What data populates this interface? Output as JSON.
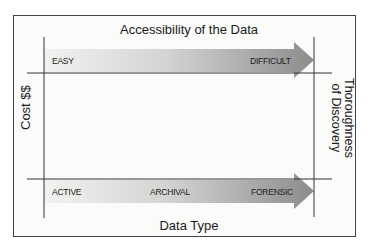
{
  "diagram": {
    "top_title": "Accessibility of the Data",
    "bottom_title": "Data Type",
    "left_axis_label": "Cost $$",
    "right_axis_label_line1": "Thoroughness",
    "right_axis_label_line2": "of Discovery",
    "top_arrow": {
      "start_label": "EASY",
      "end_label": "DIFFICULT"
    },
    "bottom_arrow": {
      "start_label": "ACTIVE",
      "middle_label": "ARCHIVAL",
      "end_label": "FORENSIC"
    },
    "colors": {
      "arrow_light": "#f0f0ee",
      "arrow_dark": "#8f8f8f",
      "line": "#333333",
      "border": "#444444"
    }
  }
}
